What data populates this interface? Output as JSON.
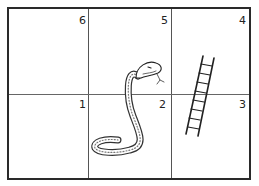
{
  "board": {
    "rows": 2,
    "cols": 3,
    "squares": [
      {
        "label": "6"
      },
      {
        "label": "5"
      },
      {
        "label": "4"
      },
      {
        "label": "1"
      },
      {
        "label": "2"
      },
      {
        "label": "3"
      }
    ]
  },
  "figures": {
    "snake": "snake-icon",
    "ladder": "ladder-icon"
  }
}
